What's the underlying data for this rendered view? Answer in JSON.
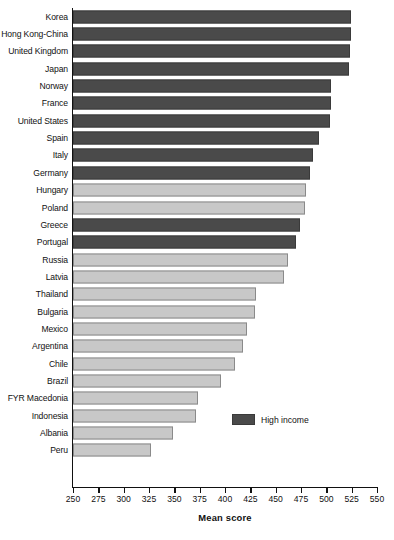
{
  "chart_data": {
    "type": "bar",
    "orientation": "horizontal",
    "title": "",
    "xlabel": "Mean score",
    "ylabel": "",
    "xlim": [
      250,
      550
    ],
    "xticks": [
      250,
      275,
      300,
      325,
      350,
      375,
      400,
      425,
      450,
      475,
      500,
      525,
      550
    ],
    "grid": false,
    "legend": {
      "position": "inside-right-lower",
      "entries": [
        {
          "label": "High income",
          "color": "#4a4a4a"
        }
      ]
    },
    "colors": {
      "high_income": "#4a4a4a",
      "other": "#c8c8c8",
      "axis": "#111111"
    },
    "categories": [
      "Korea",
      "Hong Kong-China",
      "United Kingdom",
      "Japan",
      "Norway",
      "France",
      "United States",
      "Spain",
      "Italy",
      "Germany",
      "Hungary",
      "Poland",
      "Greece",
      "Portugal",
      "Russia",
      "Latvia",
      "Thailand",
      "Bulgaria",
      "Mexico",
      "Argentina",
      "Chile",
      "Brazil",
      "FYR Macedonia",
      "Indonesia",
      "Albania",
      "Peru"
    ],
    "values": [
      524,
      524,
      523,
      522,
      505,
      505,
      504,
      493,
      487,
      484,
      480,
      479,
      474,
      470,
      462,
      458,
      431,
      430,
      422,
      418,
      410,
      396,
      373,
      371,
      349,
      327
    ],
    "series_group": [
      "high",
      "high",
      "high",
      "high",
      "high",
      "high",
      "high",
      "high",
      "high",
      "high",
      "other",
      "other",
      "high",
      "high",
      "other",
      "other",
      "other",
      "other",
      "other",
      "other",
      "other",
      "other",
      "other",
      "other",
      "other",
      "other"
    ]
  }
}
